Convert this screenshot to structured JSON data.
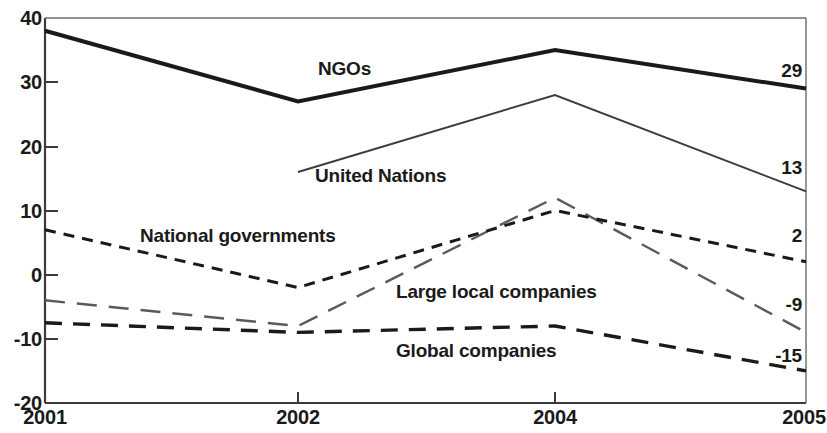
{
  "chart_data": {
    "type": "line",
    "title": "",
    "subtitle": "",
    "xlabel": "",
    "ylabel": "",
    "x": [
      "2001",
      "2002",
      "2004",
      "2005"
    ],
    "xtick_labels": [
      "2001",
      "2002",
      "2004",
      "2005"
    ],
    "ytick_labels": [
      "40",
      "30",
      "20",
      "10",
      "0",
      "-10",
      "-20"
    ],
    "ytick_values": [
      40,
      30,
      20,
      10,
      0,
      -10,
      -20
    ],
    "ylim": [
      -20,
      40
    ],
    "grid": false,
    "legend_position": "inline-labels",
    "series": [
      {
        "name": "NGOs",
        "label": "NGOs",
        "style": "solid-thick",
        "color": "#1a1a1a",
        "x": [
          "2001",
          "2002",
          "2004",
          "2005"
        ],
        "values": [
          38,
          27,
          35,
          29
        ],
        "end_value": "29"
      },
      {
        "name": "United Nations",
        "label": "United Nations",
        "style": "solid-thin",
        "color": "#3c3c3c",
        "x": [
          "2002",
          "2004",
          "2005"
        ],
        "values": [
          16,
          28,
          13
        ],
        "end_value": "13"
      },
      {
        "name": "National governments",
        "label": "National governments",
        "style": "dashed-short",
        "color": "#1a1a1a",
        "x": [
          "2001",
          "2002",
          "2004",
          "2005"
        ],
        "values": [
          7,
          -2,
          10,
          2
        ],
        "end_value": "2"
      },
      {
        "name": "Large local companies",
        "label": "Large local companies",
        "style": "dashed-long-gray",
        "color": "#555555",
        "x": [
          "2001",
          "2002",
          "2004",
          "2005"
        ],
        "values": [
          -4,
          -8,
          12,
          -9
        ],
        "end_value": "-9"
      },
      {
        "name": "Global companies",
        "label": "Global companies",
        "style": "dashed-medium-thick",
        "color": "#1a1a1a",
        "x": [
          "2001",
          "2002",
          "2004",
          "2005"
        ],
        "values": [
          -7.5,
          -9,
          -8,
          -15
        ],
        "end_value": "-15"
      }
    ],
    "annotations": [
      {
        "text": "NGOs",
        "series": "NGOs"
      },
      {
        "text": "United Nations",
        "series": "United Nations"
      },
      {
        "text": "National governments",
        "series": "National governments"
      },
      {
        "text": "Large local companies",
        "series": "Large local companies"
      },
      {
        "text": "Global companies",
        "series": "Global companies"
      }
    ],
    "end_labels": [
      "29",
      "13",
      "2",
      "-9",
      "-15"
    ]
  },
  "axis": {
    "y": {
      "t40": "40",
      "t30": "30",
      "t20": "20",
      "t10": "10",
      "t0": "0",
      "tm10": "-10",
      "tm20": "-20"
    },
    "x": {
      "t2001": "2001",
      "t2002": "2002",
      "t2004": "2004",
      "t2005": "2005"
    }
  },
  "labels": {
    "ngos": "NGOs",
    "united_nations": "United Nations",
    "national_governments": "National governments",
    "large_local_companies": "Large local companies",
    "global_companies": "Global companies"
  },
  "end_values": {
    "ngos": "29",
    "united_nations": "13",
    "national_governments": "2",
    "large_local_companies": "-9",
    "global_companies": "-15"
  }
}
